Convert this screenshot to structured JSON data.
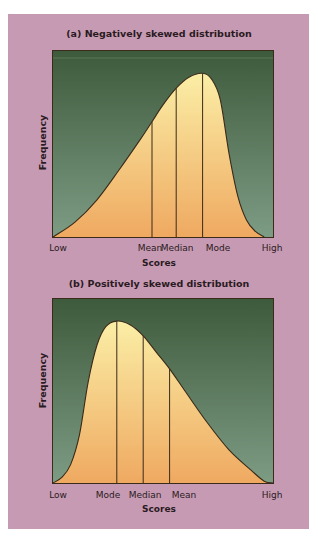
{
  "colors": {
    "background_panel": "#c79ab3",
    "plot_bg_top": "#3e5a3c",
    "plot_bg_bottom": "#7d9c84",
    "fill_top": "#fbeea6",
    "fill_bottom": "#efa961",
    "line": "#3a2a1a"
  },
  "chart_data": [
    {
      "type": "area",
      "title": "(a) Negatively skewed distribution",
      "xlabel": "Scores",
      "ylabel": "Frequency",
      "x_ticks": [
        "Low",
        "Mean",
        "Median",
        "Mode",
        "High"
      ],
      "markers": [
        {
          "label": "Mean",
          "x": 0.45
        },
        {
          "label": "Median",
          "x": 0.56
        },
        {
          "label": "Mode",
          "x": 0.68
        }
      ],
      "skew": "negative",
      "curve_points": [
        [
          0,
          0
        ],
        [
          0.1,
          0.08
        ],
        [
          0.2,
          0.2
        ],
        [
          0.3,
          0.36
        ],
        [
          0.4,
          0.53
        ],
        [
          0.45,
          0.62
        ],
        [
          0.5,
          0.71
        ],
        [
          0.56,
          0.8
        ],
        [
          0.62,
          0.86
        ],
        [
          0.68,
          0.88
        ],
        [
          0.72,
          0.85
        ],
        [
          0.76,
          0.74
        ],
        [
          0.8,
          0.45
        ],
        [
          0.84,
          0.22
        ],
        [
          0.88,
          0.09
        ],
        [
          0.92,
          0.03
        ],
        [
          0.96,
          0
        ]
      ]
    },
    {
      "type": "area",
      "title": "(b) Positively skewed distribution",
      "xlabel": "Scores",
      "ylabel": "Frequency",
      "x_ticks": [
        "Low",
        "Mode",
        "Median",
        "Mean",
        "High"
      ],
      "markers": [
        {
          "label": "Mode",
          "x": 0.29
        },
        {
          "label": "Median",
          "x": 0.41
        },
        {
          "label": "Mean",
          "x": 0.53
        }
      ],
      "skew": "positive",
      "curve_points": [
        [
          0,
          0
        ],
        [
          0.04,
          0.03
        ],
        [
          0.08,
          0.1
        ],
        [
          0.12,
          0.26
        ],
        [
          0.16,
          0.55
        ],
        [
          0.2,
          0.75
        ],
        [
          0.24,
          0.85
        ],
        [
          0.29,
          0.88
        ],
        [
          0.35,
          0.86
        ],
        [
          0.41,
          0.8
        ],
        [
          0.47,
          0.71
        ],
        [
          0.53,
          0.62
        ],
        [
          0.6,
          0.5
        ],
        [
          0.7,
          0.33
        ],
        [
          0.8,
          0.18
        ],
        [
          0.9,
          0.07
        ],
        [
          0.96,
          0.01
        ],
        [
          1.0,
          0
        ]
      ]
    }
  ],
  "labels": {
    "a": {
      "title": "(a) Negatively skewed distribution",
      "ylabel": "Frequency",
      "xlabel": "Scores",
      "low": "Low",
      "t1": "Mean",
      "t2": "Median",
      "t3": "Mode",
      "high": "High"
    },
    "b": {
      "title": "(b) Positively skewed distribution",
      "ylabel": "Frequency",
      "xlabel": "Scores",
      "low": "Low",
      "t1": "Mode",
      "t2": "Median",
      "t3": "Mean",
      "high": "High"
    }
  }
}
